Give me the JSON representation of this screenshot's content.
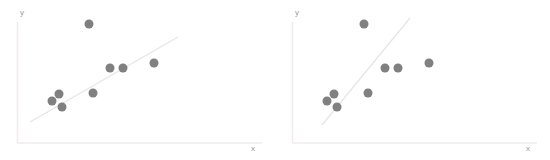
{
  "figure": {
    "background_color": "#ffffff",
    "width": 550,
    "height": 160,
    "panel_count": 2
  },
  "style": {
    "point_color": "#808080",
    "point_radius": 4.5,
    "line_color": "#e8e6e4",
    "axis_color": "#f0eeec",
    "label_color": "#9a9a9a"
  },
  "chart_data": [
    {
      "type": "scatter",
      "title": "",
      "subtitle": "",
      "xlabel": "x",
      "ylabel": "y",
      "grid": false,
      "legend": false,
      "xlim": [
        0,
        10
      ],
      "ylim": [
        0,
        10
      ],
      "axis_ticks": [],
      "points": [
        {
          "x": 1.7,
          "y": 3.3
        },
        {
          "x": 2.25,
          "y": 3.95
        },
        {
          "x": 2.5,
          "y": 2.85
        },
        {
          "x": 3.6,
          "y": 4.35
        },
        {
          "x": 4.45,
          "y": 6.45
        },
        {
          "x": 5.45,
          "y": 6.45
        },
        {
          "x": 7.05,
          "y": 6.85
        },
        {
          "x": 3.3,
          "y": 10.2
        },
        {
          "x": 0.0,
          "y": 0.0
        }
      ],
      "points_pixels": [
        {
          "x": 52,
          "y": 101
        },
        {
          "x": 59,
          "y": 94
        },
        {
          "x": 62,
          "y": 107
        },
        {
          "x": 93,
          "y": 93
        },
        {
          "x": 110,
          "y": 68
        },
        {
          "x": 123,
          "y": 68
        },
        {
          "x": 154,
          "y": 63
        },
        {
          "x": 89,
          "y": 24
        }
      ],
      "fit_line": {
        "label": "regression line",
        "slope_描述": "shallow",
        "start_pixel": {
          "x": 30,
          "y": 122
        },
        "end_pixel": {
          "x": 178,
          "y": 37
        }
      }
    },
    {
      "type": "scatter",
      "title": "",
      "subtitle": "",
      "xlabel": "x",
      "ylabel": "y",
      "grid": false,
      "legend": false,
      "xlim": [
        0,
        10
      ],
      "ylim": [
        0,
        10
      ],
      "axis_ticks": [],
      "points": [
        {
          "x": 1.7,
          "y": 3.3
        },
        {
          "x": 2.25,
          "y": 3.95
        },
        {
          "x": 2.5,
          "y": 2.85
        },
        {
          "x": 3.6,
          "y": 4.35
        },
        {
          "x": 4.45,
          "y": 6.45
        },
        {
          "x": 5.45,
          "y": 6.45
        },
        {
          "x": 7.05,
          "y": 6.85
        },
        {
          "x": 3.3,
          "y": 10.2
        }
      ],
      "points_pixels": [
        {
          "x": 52,
          "y": 101
        },
        {
          "x": 59,
          "y": 94
        },
        {
          "x": 62,
          "y": 107
        },
        {
          "x": 93,
          "y": 93
        },
        {
          "x": 110,
          "y": 68
        },
        {
          "x": 123,
          "y": 68
        },
        {
          "x": 154,
          "y": 63
        },
        {
          "x": 89,
          "y": 24
        }
      ],
      "fit_line": {
        "label": "regression line",
        "slope_描述": "steep",
        "start_pixel": {
          "x": 47,
          "y": 125
        },
        "end_pixel": {
          "x": 135,
          "y": 18
        }
      }
    }
  ],
  "panels": [
    {
      "id": "left-panel",
      "name": "scatter-plot-left",
      "xlabel": "x",
      "ylabel": "y"
    },
    {
      "id": "right-panel",
      "name": "scatter-plot-right",
      "xlabel": "x",
      "ylabel": "y"
    }
  ]
}
